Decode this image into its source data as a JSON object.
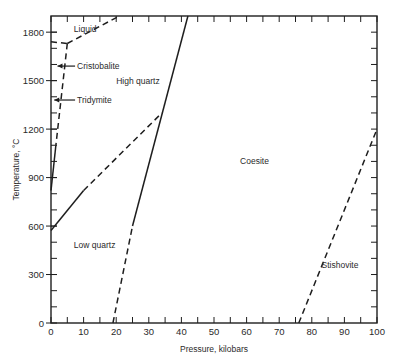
{
  "chart_data": {
    "type": "line",
    "title": "",
    "xlabel": "Pressure, kilobars",
    "ylabel": "Temperature, °C",
    "xlim": [
      0,
      100
    ],
    "ylim": [
      0,
      1900
    ],
    "grid": false,
    "x_ticks": [
      0,
      10,
      20,
      30,
      40,
      50,
      60,
      70,
      80,
      90,
      100
    ],
    "x_minor_ticks": [
      5,
      15,
      25,
      35,
      45,
      55,
      65,
      75,
      85,
      95
    ],
    "y_ticks": [
      0,
      300,
      600,
      900,
      1200,
      1500,
      1800
    ],
    "y_minor_step": 100,
    "series": [
      {
        "name": "liquidus",
        "style": "dashed",
        "points": [
          [
            5,
            1730
          ],
          [
            21,
            1900
          ]
        ]
      },
      {
        "name": "liquid-cristobalite",
        "style": "dashed",
        "points": [
          [
            0,
            1740
          ],
          [
            5,
            1730
          ]
        ]
      },
      {
        "name": "cristobalite-tridymite-quartz boundary",
        "style": "dashed",
        "points": [
          [
            5,
            1730
          ],
          [
            1.5,
            1100
          ]
        ]
      },
      {
        "name": "tridymite-high quartz (solid)",
        "style": "solid",
        "points": [
          [
            1.5,
            1100
          ],
          [
            0,
            820
          ]
        ]
      },
      {
        "name": "low-high quartz (solid)",
        "style": "solid",
        "points": [
          [
            0,
            573
          ],
          [
            10,
            820
          ]
        ]
      },
      {
        "name": "low-high quartz (dashed)",
        "style": "dashed",
        "points": [
          [
            10,
            820
          ],
          [
            34,
            1300
          ]
        ]
      },
      {
        "name": "quartz-coesite (dashed)",
        "style": "dashed",
        "points": [
          [
            19,
            0
          ],
          [
            25,
            600
          ]
        ]
      },
      {
        "name": "quartz-coesite (solid)",
        "style": "solid",
        "points": [
          [
            25,
            600
          ],
          [
            42,
            1900
          ]
        ]
      },
      {
        "name": "coesite-stishovite",
        "style": "dashed",
        "points": [
          [
            76,
            0
          ],
          [
            100,
            1200
          ]
        ]
      }
    ],
    "annotations": [
      {
        "text": "Liquid",
        "x": 7,
        "y": 1820
      },
      {
        "text": "Cristobalite",
        "x": 8,
        "y": 1590,
        "arrow_to": [
          2,
          1590
        ]
      },
      {
        "text": "High quartz",
        "x": 20,
        "y": 1500
      },
      {
        "text": "Tridymite",
        "x": 8,
        "y": 1380,
        "arrow_to": [
          1,
          1380
        ]
      },
      {
        "text": "Coesite",
        "x": 58,
        "y": 1000
      },
      {
        "text": "Low quartz",
        "x": 7,
        "y": 480
      },
      {
        "text": "Stishovite",
        "x": 83,
        "y": 360
      }
    ]
  }
}
